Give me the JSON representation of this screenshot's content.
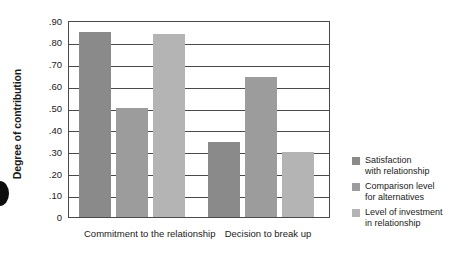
{
  "chart_data": {
    "type": "bar",
    "title": "",
    "subtitle": "",
    "xlabel": "",
    "ylabel": "Degree of contribution",
    "ylim": [
      0,
      0.9
    ],
    "grid": true,
    "legend_position": "right",
    "categories": [
      "Commitment to\nthe relationship",
      "Decision to\nbreak up"
    ],
    "y_ticks": [
      0.9,
      0.8,
      0.7,
      0.6,
      0.5,
      0.4,
      0.3,
      0.2,
      0.1,
      0
    ],
    "y_tick_labels": [
      ".90",
      ".80",
      ".70",
      ".60",
      ".50",
      ".40",
      ".30",
      ".20",
      ".10",
      "0"
    ],
    "series": [
      {
        "name": "Satisfaction\nwith relationship",
        "color": "#8a8a8a",
        "values": [
          0.855,
          0.345
        ]
      },
      {
        "name": "Comparison level\nfor alternatives",
        "color": "#9c9c9c",
        "values": [
          0.505,
          0.648
        ]
      },
      {
        "name": "Level of investment\nin relationship",
        "color": "#b4b4b4",
        "values": [
          0.845,
          0.3
        ]
      }
    ]
  },
  "axis": {
    "y_title": "Degree of contribution",
    "tick_0": ".90",
    "tick_1": ".80",
    "tick_2": ".70",
    "tick_3": ".60",
    "tick_4": ".50",
    "tick_5": ".40",
    "tick_6": ".30",
    "tick_7": ".20",
    "tick_8": ".10",
    "tick_9": "0"
  },
  "categories": {
    "cat_0": "Commitment to\nthe relationship",
    "cat_1": "Decision to\nbreak up"
  },
  "legend": {
    "item_0": "Satisfaction\nwith relationship",
    "item_1": "Comparison level\nfor alternatives",
    "item_2": "Level of investment\nin relationship"
  }
}
